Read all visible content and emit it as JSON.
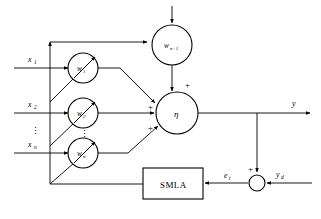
{
  "diagram": {
    "inputs": [
      {
        "label": "x",
        "sub": "1",
        "name": "input-x1"
      },
      {
        "label": "x",
        "sub": "2",
        "name": "input-x2"
      },
      {
        "label": "x",
        "sub": "n",
        "name": "input-xn"
      }
    ],
    "input_ellipsis": "⋮",
    "weights": [
      {
        "label": "w",
        "sub": "1",
        "name": "weight-node-w1"
      },
      {
        "label": "w",
        "sub": "2",
        "name": "weight-node-w2"
      },
      {
        "label": "w",
        "sub": "n",
        "name": "weight-node-wn"
      }
    ],
    "weight_ellipsis": "⋮",
    "bias_weight": {
      "label": "w",
      "sub": "n+1",
      "name": "bias-weight-node"
    },
    "summation": {
      "label": "η",
      "name": "summation-node"
    },
    "summation_signs": [
      "+",
      "+",
      "+"
    ],
    "output": {
      "label": "y",
      "name": "output-y"
    },
    "adaptation_block": {
      "label": "SMLA",
      "name": "smla-block"
    },
    "error": {
      "label": "e",
      "sub": "t",
      "name": "error-signal-et"
    },
    "error_junction": {
      "sign": "+",
      "name": "error-summing-junction"
    },
    "desired": {
      "label": "y",
      "sub": "d",
      "name": "desired-output-yd"
    }
  },
  "colors": {
    "stroke": "#000000",
    "background": "#ffffff"
  }
}
